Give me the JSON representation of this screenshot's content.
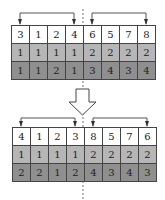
{
  "diagram": {
    "colors": {
      "row1": "#ffffff",
      "row2": "#b6b6b6",
      "row3": "#8f8f8f",
      "border": "#444444",
      "arrow": "#555555"
    },
    "before": {
      "rows": [
        [
          "3",
          "1",
          "2",
          "4",
          "6",
          "5",
          "7",
          "8"
        ],
        [
          "1",
          "1",
          "1",
          "1",
          "2",
          "2",
          "2",
          "2"
        ],
        [
          "1",
          "1",
          "2",
          "1",
          "3",
          "4",
          "3",
          "4"
        ]
      ],
      "swaps": [
        {
          "from_col": 1,
          "to_col": 4
        },
        {
          "from_col": 5,
          "to_col": 8
        }
      ]
    },
    "after": {
      "rows": [
        [
          "4",
          "1",
          "2",
          "3",
          "8",
          "5",
          "7",
          "6"
        ],
        [
          "1",
          "1",
          "1",
          "1",
          "2",
          "2",
          "2",
          "2"
        ],
        [
          "2",
          "2",
          "1",
          "2",
          "4",
          "3",
          "4",
          "3"
        ]
      ],
      "swaps": [
        {
          "from_col": 1,
          "to_col": 4
        },
        {
          "from_col": 5,
          "to_col": 8
        }
      ]
    },
    "transition_arrow": "hollow-down-arrow",
    "divider": "dashed-vertical-line"
  }
}
